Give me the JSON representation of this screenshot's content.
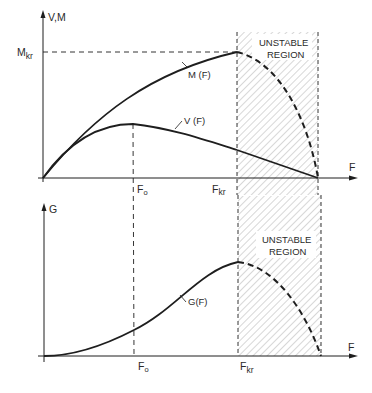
{
  "colors": {
    "ink": "#1e1e1e",
    "hatch": "#6e6e6e",
    "background": "#ffffff"
  },
  "top_panel": {
    "y_axis_label": "V,M",
    "x_axis_label": "F",
    "mkr_label": "M",
    "mkr_sub": "kr",
    "fo_label": "F",
    "fo_sub": "o",
    "fkr_label": "F",
    "fkr_sub": "kr",
    "curve_m_label": "M (F)",
    "curve_v_label": "V (F)",
    "region_line1": "UNSTABLE",
    "region_line2": "REGION"
  },
  "bottom_panel": {
    "y_axis_label": "G",
    "x_axis_label": "F",
    "fo_label": "F",
    "fo_sub": "o",
    "fkr_label": "F",
    "fkr_sub": "kr",
    "curve_g_label": "G(F)",
    "region_line1": "UNSTABLE",
    "region_line2": "REGION"
  }
}
